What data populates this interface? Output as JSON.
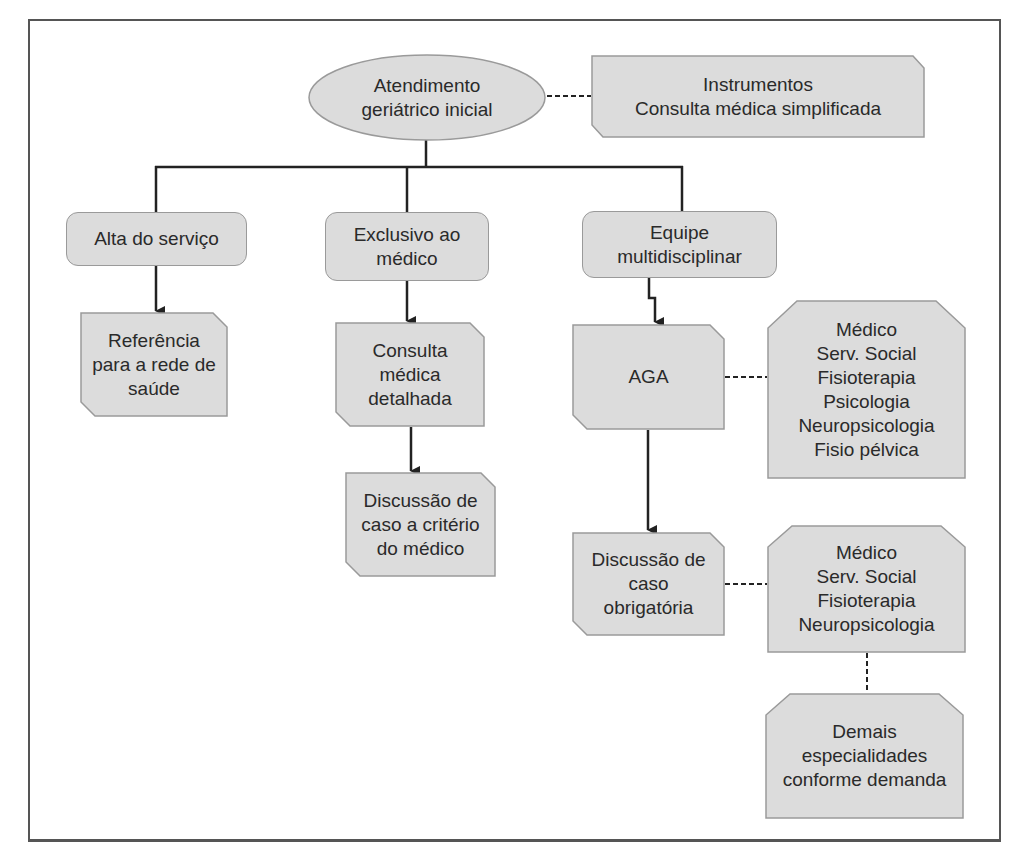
{
  "diagram": {
    "type": "flowchart",
    "colors": {
      "box_fill": "#dcdcdc",
      "box_border": "#9a9a9a",
      "line": "#222222",
      "frame": "#555555"
    },
    "nodes": {
      "root": {
        "label": "Atendimento\ngeriátrico inicial",
        "shape": "ellipse"
      },
      "instruments": {
        "label": "Instrumentos\nConsulta médica simplificada",
        "shape": "cut-corner"
      },
      "discharge": {
        "label": "Alta do serviço",
        "shape": "rounded"
      },
      "doctor_only": {
        "label": "Exclusivo ao\nmédico",
        "shape": "rounded"
      },
      "team": {
        "label": "Equipe\nmultidisciplinar",
        "shape": "rounded"
      },
      "referral": {
        "label": "Referência\npara a rede de\nsaúde",
        "shape": "cut-corner"
      },
      "detailed_consult": {
        "label": "Consulta\nmédica\ndetalhada",
        "shape": "cut-corner"
      },
      "case_discussion_optional": {
        "label": "Discussão de\ncaso a critério\ndo médico",
        "shape": "cut-corner"
      },
      "aga": {
        "label": "AGA",
        "shape": "cut-corner"
      },
      "aga_team": {
        "label": "Médico\nServ. Social\nFisioterapia\nPsicologia\nNeuropsicologia\nFisio pélvica",
        "shape": "octagon-top"
      },
      "case_discussion_mandatory": {
        "label": "Discussão de\ncaso\nobrigatória",
        "shape": "cut-corner"
      },
      "discussion_team": {
        "label": "Médico\nServ. Social\nFisioterapia\nNeuropsicologia",
        "shape": "octagon-top"
      },
      "other_specialties": {
        "label": "Demais\nespecialidades\nconforme demanda",
        "shape": "octagon-top"
      }
    },
    "edges": [
      {
        "from": "root",
        "to": "instruments",
        "style": "dashed"
      },
      {
        "from": "root",
        "to": "discharge",
        "style": "solid"
      },
      {
        "from": "root",
        "to": "doctor_only",
        "style": "solid"
      },
      {
        "from": "root",
        "to": "team",
        "style": "solid"
      },
      {
        "from": "discharge",
        "to": "referral",
        "style": "arrow"
      },
      {
        "from": "doctor_only",
        "to": "detailed_consult",
        "style": "arrow"
      },
      {
        "from": "detailed_consult",
        "to": "case_discussion_optional",
        "style": "arrow"
      },
      {
        "from": "team",
        "to": "aga",
        "style": "arrow-zigzag"
      },
      {
        "from": "aga",
        "to": "aga_team",
        "style": "dashed"
      },
      {
        "from": "aga",
        "to": "case_discussion_mandatory",
        "style": "arrow"
      },
      {
        "from": "case_discussion_mandatory",
        "to": "discussion_team",
        "style": "dashed"
      },
      {
        "from": "discussion_team",
        "to": "other_specialties",
        "style": "dashed"
      }
    ]
  }
}
